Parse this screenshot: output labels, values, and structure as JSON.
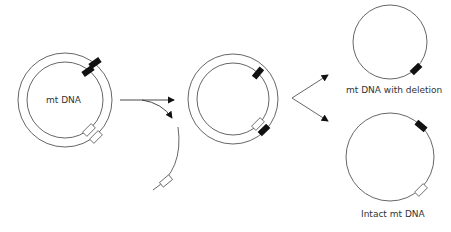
{
  "diagram": {
    "labels": {
      "parent": "mt DNA",
      "deleted": "mt DNA with deletion",
      "intact": "Intact mt DNA"
    },
    "colors": {
      "line": "#555555",
      "block_filled": "#111111",
      "block_open": "#ffffff"
    }
  }
}
